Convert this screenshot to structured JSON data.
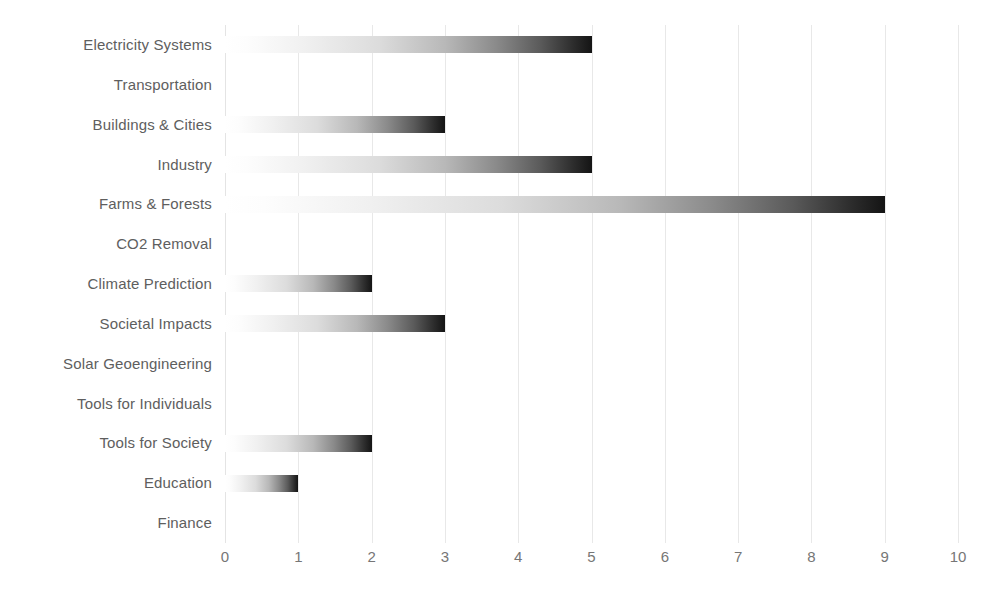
{
  "chart_data": {
    "type": "bar",
    "orientation": "horizontal",
    "title": "",
    "subtitle": "",
    "xlabel": "",
    "ylabel": "",
    "xlim": [
      0,
      10
    ],
    "ylim": null,
    "xticks": [
      "0",
      "1",
      "2",
      "3",
      "4",
      "5",
      "6",
      "7",
      "8",
      "9",
      "10"
    ],
    "grid": "vertical",
    "legend": null,
    "legend_position": "none",
    "bar_style": "gradient-light-to-dark",
    "categories": [
      "Electricity Systems",
      "Transportation",
      "Buildings & Cities",
      "Industry",
      "Farms & Forests",
      "CO2 Removal",
      "Climate Prediction",
      "Societal Impacts",
      "Solar Geoengineering",
      "Tools for Individuals",
      "Tools for Society",
      "Education",
      "Finance"
    ],
    "values": [
      5,
      0,
      3,
      5,
      9,
      0,
      2,
      3,
      0,
      0,
      2,
      1,
      0
    ]
  },
  "colors": {
    "background": "#ffffff",
    "gridline": "#e8e8e8",
    "category_label": "#5e5e5e",
    "tick_label": "#767676",
    "bar_gradient_start": "#ffffff",
    "bar_gradient_end": "#141414"
  }
}
